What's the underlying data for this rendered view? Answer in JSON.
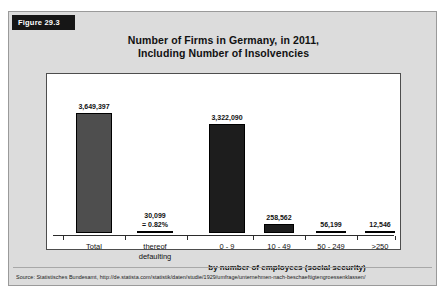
{
  "figure": {
    "tag": "Figure 29.3",
    "title_line1": "Number of Firms in Germany, in 2011,",
    "title_line2": "Including Number of Insolvencies",
    "source": "Source: Statistisches Bundesamt, http://de.statista.com/statistik/daten/studie/1929/umfrage/unternehmen-nach-beschaeftigtengroessenklassen/"
  },
  "chart_data": {
    "type": "bar",
    "title": "Number of Firms in Germany, in 2011, Including Number of Insolvencies",
    "xlabel": "by number of employees (social security)",
    "ylabel": "",
    "ylim": [
      0,
      3800000
    ],
    "grid": false,
    "legend": "none",
    "categories": [
      "Total",
      "thereof defaulting",
      "0 - 9",
      "10 - 49",
      "50 - 249",
      ">250"
    ],
    "values": [
      3649397,
      30099,
      3322090,
      258562,
      56199,
      12546
    ],
    "bars": [
      {
        "category_line1": "Total",
        "category_line2": "",
        "value_label": "3,649,397",
        "value_label2": "",
        "value": 3649397,
        "color": "#4e4e4e"
      },
      {
        "category_line1": "thereof",
        "category_line2": "defaulting",
        "value_label": "30,099",
        "value_label2": "= 0.82%",
        "value": 30099,
        "color": "#1d1d1d"
      },
      {
        "category_line1": "0 - 9",
        "category_line2": "",
        "value_label": "3,322,090",
        "value_label2": "",
        "value": 3322090,
        "color": "#1d1d1d"
      },
      {
        "category_line1": "10 - 49",
        "category_line2": "",
        "value_label": "258,562",
        "value_label2": "",
        "value": 258562,
        "color": "#1d1d1d"
      },
      {
        "category_line1": "50 - 249",
        "category_line2": "",
        "value_label": "56,199",
        "value_label2": "",
        "value": 56199,
        "color": "#1d1d1d"
      },
      {
        "category_line1": ">250",
        "category_line2": "",
        "value_label": "12,546",
        "value_label2": "",
        "value": 12546,
        "color": "#1d1d1d"
      }
    ],
    "group_axis_label": "by number of employees (social security)",
    "colors": {
      "bar_total": "#4e4e4e",
      "bar_default": "#1d1d1d",
      "axis": "#2b2b2b",
      "panel_bg": "#ffffff",
      "page_bg": "#dcdcdc"
    }
  }
}
